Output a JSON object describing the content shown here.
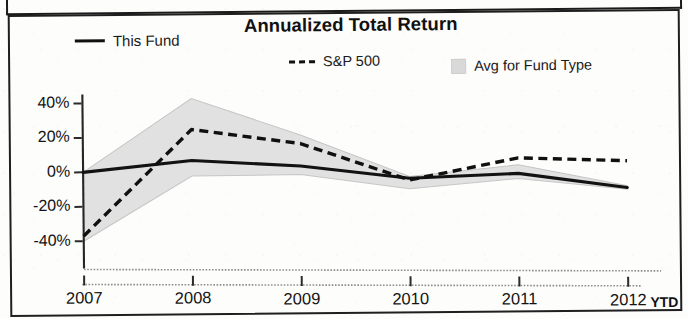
{
  "panel": {
    "title": "Annualized Total Return"
  },
  "legend": {
    "items": [
      {
        "label": "This Fund",
        "marker": "solid-line-swatch",
        "color": "#111111"
      },
      {
        "label": "S&P 500",
        "marker": "dashed-line-swatch",
        "color": "#111111"
      },
      {
        "label": "Avg for Fund Type",
        "marker": "shaded-band-swatch",
        "color": "#d9d9d9"
      }
    ]
  },
  "axes": {
    "y_ticks": [
      "40%",
      "20%",
      "0%",
      "-20%",
      "-40%"
    ],
    "x_ticks": [
      "2007",
      "2008",
      "2009",
      "2010",
      "2011",
      "2012"
    ],
    "x_suffix": "YTD"
  },
  "chart_data": {
    "type": "line",
    "title": "Annualized Total Return",
    "xlabel": "",
    "ylabel": "",
    "categories": [
      "2007",
      "2008",
      "2009",
      "2010",
      "2011",
      "2012"
    ],
    "x_note": "2012 value is YTD",
    "ylim": [
      -50,
      48
    ],
    "y_ticks": [
      40,
      20,
      0,
      -20,
      -40
    ],
    "y_tick_labels": [
      "40%",
      "20%",
      "0%",
      "-20%",
      "-40%"
    ],
    "grid": false,
    "legend_position": "top",
    "series": [
      {
        "name": "This Fund",
        "style": "solid",
        "color": "#121212",
        "values": [
          0,
          7,
          4,
          -3,
          0,
          -8
        ]
      },
      {
        "name": "S&P 500",
        "style": "dashed",
        "color": "#101010",
        "values": [
          -37,
          25,
          17,
          -4,
          9,
          7.5
        ]
      },
      {
        "name": "Avg for Fund Type",
        "style": "band",
        "color": "#dedede",
        "upper": [
          0,
          43,
          22,
          -2,
          5,
          -7
        ],
        "lower": [
          -40,
          -2,
          -1,
          -9,
          -3,
          -9
        ]
      }
    ]
  }
}
